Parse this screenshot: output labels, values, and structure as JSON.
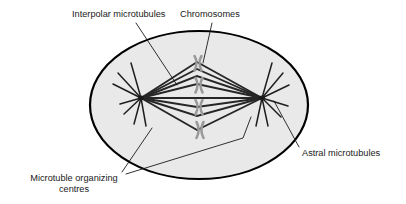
{
  "figure": {
    "background_color": "#ffffff",
    "cell": {
      "name": "cell-membrane",
      "fill_color": "#e9e9e9",
      "stroke_color": "#000000",
      "stroke_width": 2.2,
      "center_x": 199,
      "center_y": 105,
      "radius_x": 109,
      "radius_y": 74
    }
  },
  "labels": {
    "interpolar": {
      "text": "Interpolar microtubules",
      "x": 72,
      "y": 17,
      "anchor": "start"
    },
    "chromosomes": {
      "text": "Chromosomes",
      "x": 180,
      "y": 17,
      "anchor": "start"
    },
    "astral": {
      "text": "Astral microtubules",
      "x": 302,
      "y": 156,
      "anchor": "start"
    },
    "mtoc_line1": {
      "text": "Microtuble organizing",
      "x": 74,
      "y": 181,
      "anchor": "middle"
    },
    "mtoc_line2": {
      "text": "centres",
      "x": 74,
      "y": 192,
      "anchor": "middle"
    }
  },
  "leaders": {
    "stroke_color": "#1a1a1a",
    "stroke_width": 0.9,
    "interpolar": "M136,23 L177,85",
    "chromosomes": "M212,23 L203,63",
    "astral": "M299,147 L274,101",
    "mtoc_left": "M122,172 L152,128",
    "mtoc_right": "M126,174 L243,138 L251,117"
  },
  "spindle": {
    "pole_left_x": 141,
    "pole_right_x": 262,
    "pole_y": 98,
    "fiber_color": "#262626",
    "fiber_width": 1.9,
    "astral_color": "#1f1f1f",
    "astral_width": 1.5,
    "interpolar_fibers": [
      "M141,98 L197,62 L262,98",
      "M141,98 L197,69 L262,98",
      "M141,98 L197,76 L262,98",
      "M141,98 L197,84 L262,98",
      "M141,98 L262,98",
      "M141,98 L197,107 L262,98",
      "M141,98 L197,116 L262,98",
      "M141,98 L197,130 L262,98"
    ],
    "astral_left": [
      "M141,98 L113,84",
      "M141,98 L118,73",
      "M141,98 L131,63",
      "M141,98 L120,104",
      "M141,98 L124,114",
      "M141,98 L134,124",
      "M141,98 L146,126"
    ],
    "astral_right": [
      "M262,98 L289,85",
      "M262,98 L283,73",
      "M262,98 L272,63",
      "M262,98 L288,106",
      "M262,98 L281,117",
      "M262,98 L268,126",
      "M262,98 L256,126"
    ]
  },
  "chromosomes": {
    "color": "#9a9a9a",
    "count": 4,
    "items": [
      {
        "cx": 198,
        "cy": 63,
        "w": 8,
        "h": 15
      },
      {
        "cx": 199,
        "cy": 85,
        "w": 8,
        "h": 15
      },
      {
        "cx": 199,
        "cy": 107,
        "w": 8,
        "h": 15
      },
      {
        "cx": 200,
        "cy": 130,
        "w": 8,
        "h": 16
      }
    ]
  }
}
